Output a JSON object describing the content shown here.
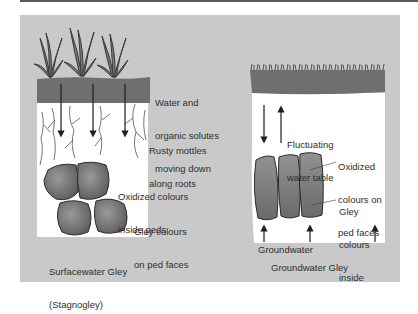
{
  "figure": {
    "colors": {
      "panel_bg": "#c9c9c9",
      "topsoil": "#6f6f6f",
      "subsoil": "#ffffff",
      "ped": "#7d7d7d",
      "text": "#2e2e2e",
      "rule": "#5a5a5a"
    },
    "left_profile": {
      "title_line1": "Surfacewater Gley",
      "title_line2": "(Stagnogley)",
      "labels": [
        {
          "lines": [
            "Water and",
            "organic solutes",
            "moving down"
          ]
        },
        {
          "lines": [
            "Rusty mottles",
            "along roots"
          ]
        },
        {
          "lines": [
            "Oxidized colours",
            "inside peds"
          ]
        },
        {
          "lines": [
            "Gley colours",
            "on ped faces"
          ]
        }
      ],
      "icons": [
        "grass-plant-icon",
        "down-arrow-icon",
        "root-icon",
        "ped-clod-icon"
      ]
    },
    "right_profile": {
      "title": "Groundwater Gley",
      "groundwater_label": "Groundwater",
      "labels": [
        {
          "lines": [
            "Fluctuating",
            "water table"
          ]
        },
        {
          "lines": [
            "Oxidized",
            "colours on",
            "ped faces"
          ]
        },
        {
          "lines": [
            "Gley",
            "colours",
            "inside"
          ]
        }
      ],
      "icons": [
        "grass-fringe-icon",
        "up-down-arrow-icon",
        "up-arrow-icon",
        "ped-prism-icon"
      ]
    }
  }
}
